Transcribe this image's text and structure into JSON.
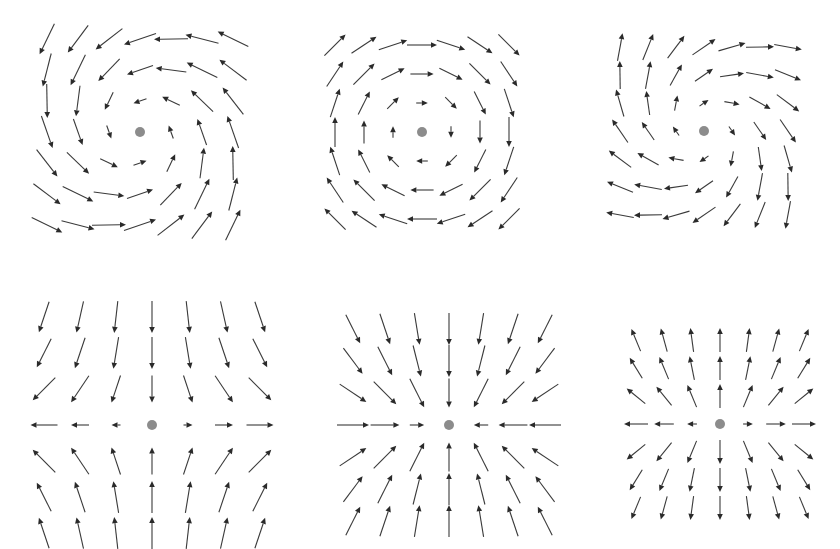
{
  "figure": {
    "arrow_color": "#2a2a2a",
    "dot_color": "#8c8c8c",
    "background": "#ffffff",
    "panels": [
      {
        "id": "spiral-sink",
        "label": "Spiral sink (inward spiral, counter-clockwise)",
        "center": [
          140,
          132
        ],
        "spacing": 31,
        "grid": 7,
        "type": "spiral",
        "a": -0.35,
        "w": -1.0,
        "scale": 0.42,
        "max_len": 34
      },
      {
        "id": "center-rotation",
        "label": "Center (pure clockwise rotation)",
        "center": [
          422,
          132
        ],
        "spacing": 29,
        "grid": 7,
        "type": "spiral",
        "a": 0.0,
        "w": 1.0,
        "scale": 0.4,
        "max_len": 30
      },
      {
        "id": "spiral-source",
        "label": "Spiral source (outward spiral, clockwise)",
        "center": [
          704,
          131
        ],
        "spacing": 28,
        "grid": 7,
        "type": "spiral",
        "a": 0.55,
        "w": 0.8,
        "scale": 0.4,
        "max_len": 28
      },
      {
        "id": "saddle",
        "label": "Saddle point",
        "center": [
          152,
          425
        ],
        "spacing": 36,
        "grid": 7,
        "type": "linear",
        "m": [
          [
            0.25,
            0.0
          ],
          [
            0.0,
            -0.75
          ]
        ],
        "scale": 1.0,
        "max_len": 32
      },
      {
        "id": "sink",
        "label": "Node sink (all inward)",
        "center": [
          449,
          425
        ],
        "spacing": 32,
        "grid": 7,
        "type": "linear",
        "m": [
          [
            -0.45,
            0.0
          ],
          [
            0.0,
            -0.9
          ]
        ],
        "scale": 1.0,
        "max_len": 32
      },
      {
        "id": "source",
        "label": "Node source (all outward)",
        "center": [
          720,
          424
        ],
        "spacing": 28,
        "grid": 7,
        "type": "linear",
        "m": [
          [
            0.35,
            0.0
          ],
          [
            0.0,
            0.85
          ]
        ],
        "scale": 1.0,
        "max_len": 24
      }
    ]
  }
}
